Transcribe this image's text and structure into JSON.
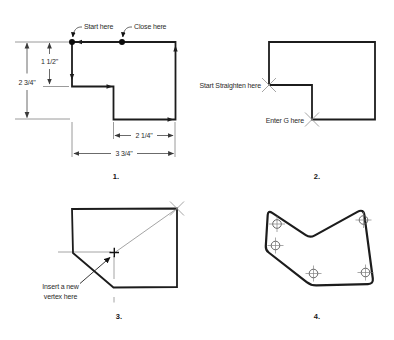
{
  "colors": {
    "background": "#ffffff",
    "shape_stroke": "#1c1c1c",
    "dimension_stroke": "#3a3a3a",
    "construction_stroke": "#9a9a9a",
    "text": "#2b2b2b"
  },
  "figures": {
    "fig1": {
      "number_label": "1.",
      "annotations": {
        "start": "Start here",
        "close": "Close here"
      },
      "dimensions": {
        "inner_height": "1 1/2\"",
        "overall_height": "2 3/4\"",
        "inner_width": "2 1/4\"",
        "overall_width": "3 3/4\""
      }
    },
    "fig2": {
      "number_label": "2.",
      "annotations": {
        "start_straighten": "Start Straighten here",
        "enter_g": "Enter G here"
      }
    },
    "fig3": {
      "number_label": "3.",
      "annotations": {
        "insert_line1": "Insert a new",
        "insert_line2": "vertex here"
      }
    },
    "fig4": {
      "number_label": "4."
    }
  }
}
